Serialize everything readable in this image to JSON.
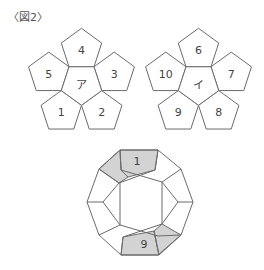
{
  "figure": {
    "label": "〈図2〉"
  },
  "net_a": {
    "center_label": "ア",
    "faces": [
      {
        "position": "top",
        "label": "4"
      },
      {
        "position": "upper-right",
        "label": "3"
      },
      {
        "position": "lower-right",
        "label": "2"
      },
      {
        "position": "lower-left",
        "label": "1"
      },
      {
        "position": "upper-left",
        "label": "5"
      }
    ]
  },
  "net_b": {
    "center_label": "イ",
    "faces": [
      {
        "position": "top",
        "label": "6"
      },
      {
        "position": "upper-right",
        "label": "7"
      },
      {
        "position": "lower-right",
        "label": "8"
      },
      {
        "position": "lower-left",
        "label": "9"
      },
      {
        "position": "upper-left",
        "label": "10"
      }
    ]
  },
  "dodecahedron": {
    "top_face_label": "1",
    "bottom_face_label": "9",
    "shade_color": "#d3d3d3",
    "line_color": "#6b6b6b"
  }
}
